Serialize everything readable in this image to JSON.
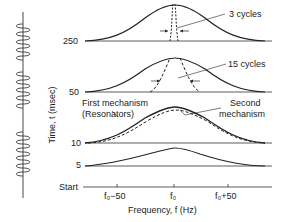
{
  "figure": {
    "y_axis_label": "Time, t (msec)",
    "x_axis_label": "Frequency, f (Hz)",
    "y_ticks": [
      "250",
      "50",
      "10",
      "5",
      "Start"
    ],
    "x_ticks": [
      "f₀−50",
      "f₀",
      "f₀+50"
    ],
    "annotations": {
      "three_cycles": "3 cycles",
      "fifteen_cycles": "15 cycles",
      "first_mechanism_line1": "First mechanism",
      "first_mechanism_line2": "(Resonators)",
      "second_mechanism_line1": "Second",
      "second_mechanism_line2": "mechanism"
    },
    "waveform": {
      "description": "tone burst waveform, vertical, three bursts",
      "bursts": 3
    },
    "colors": {
      "ink": "#222222",
      "background": "#ffffff"
    }
  }
}
